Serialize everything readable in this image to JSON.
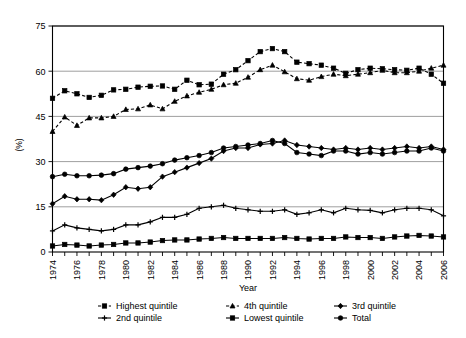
{
  "chart_data": {
    "type": "line",
    "title": "",
    "xlabel": "Year",
    "ylabel": "(%)",
    "ylim": [
      0,
      75
    ],
    "yticks": [
      0,
      15,
      30,
      45,
      60,
      75
    ],
    "xlim": [
      1974,
      2006
    ],
    "xticks": [
      1974,
      1975,
      1976,
      1977,
      1978,
      1979,
      1980,
      1981,
      1982,
      1983,
      1984,
      1985,
      1986,
      1987,
      1988,
      1989,
      1990,
      1991,
      1992,
      1993,
      1994,
      1995,
      1996,
      1997,
      1998,
      1999,
      2000,
      2001,
      2002,
      2003,
      2004,
      2005,
      2006
    ],
    "xtick_labels": [
      "1974",
      "",
      "1976",
      "",
      "1978",
      "",
      "1980",
      "",
      "1982",
      "",
      "1984",
      "",
      "1986",
      "",
      "1988",
      "",
      "1990",
      "",
      "1992",
      "",
      "1994",
      "",
      "1996",
      "",
      "1998",
      "",
      "2000",
      "",
      "2002",
      "",
      "2004",
      "",
      "2006"
    ],
    "grid": "horizontal",
    "legend_position": "bottom",
    "x": [
      1974,
      1975,
      1976,
      1977,
      1978,
      1979,
      1980,
      1981,
      1982,
      1983,
      1984,
      1985,
      1986,
      1987,
      1988,
      1989,
      1990,
      1991,
      1992,
      1993,
      1994,
      1995,
      1996,
      1997,
      1998,
      1999,
      2000,
      2001,
      2002,
      2003,
      2004,
      2005,
      2006
    ],
    "series": [
      {
        "name": "Highest quintile",
        "marker": "square",
        "linestyle": "dashed",
        "color": "#000000",
        "values": [
          51.0,
          53.5,
          52.5,
          51.3,
          52.0,
          53.8,
          54.0,
          54.7,
          55.0,
          55.1,
          54.0,
          57.0,
          55.5,
          55.7,
          59.0,
          60.5,
          63.5,
          66.5,
          67.5,
          66.5,
          63.0,
          62.5,
          62.0,
          61.0,
          59.3,
          60.5,
          61.0,
          60.8,
          60.5,
          60.3,
          61.0,
          59.0,
          56.0
        ]
      },
      {
        "name": "4th quintile",
        "marker": "triangle",
        "linestyle": "dashed",
        "color": "#000000",
        "values": [
          40.0,
          44.8,
          42.0,
          44.5,
          44.5,
          45.0,
          47.3,
          47.5,
          48.8,
          47.5,
          50.0,
          51.8,
          53.0,
          54.0,
          55.5,
          56.0,
          58.0,
          60.5,
          62.0,
          59.8,
          57.5,
          57.0,
          58.2,
          59.0,
          58.5,
          59.0,
          59.5,
          60.3,
          59.5,
          59.5,
          60.0,
          61.0,
          62.0
        ]
      },
      {
        "name": "3rd quintile",
        "marker": "diamond",
        "linestyle": "solid",
        "color": "#000000",
        "values": [
          16.0,
          18.5,
          17.5,
          17.5,
          17.2,
          19.0,
          21.5,
          21.0,
          21.5,
          25.0,
          26.5,
          28.0,
          29.5,
          31.0,
          33.5,
          34.5,
          34.5,
          35.7,
          36.0,
          37.0,
          35.5,
          35.0,
          34.5,
          34.0,
          34.5,
          34.0,
          34.5,
          34.0,
          34.5,
          35.0,
          34.5,
          35.0,
          34.0
        ]
      },
      {
        "name": "2nd quintile",
        "marker": "plus",
        "linestyle": "solid",
        "color": "#000000",
        "values": [
          7.0,
          9.0,
          8.0,
          7.5,
          7.0,
          7.5,
          9.0,
          9.0,
          10.0,
          11.5,
          11.5,
          12.5,
          14.5,
          15.0,
          15.5,
          14.5,
          14.0,
          13.5,
          13.5,
          14.0,
          12.5,
          13.0,
          14.0,
          13.0,
          14.5,
          14.0,
          13.8,
          13.0,
          14.0,
          14.5,
          14.5,
          14.0,
          12.0
        ]
      },
      {
        "name": "Lowest quintile",
        "marker": "square",
        "linestyle": "solid",
        "color": "#000000",
        "values": [
          2.0,
          2.5,
          2.3,
          2.0,
          2.3,
          2.5,
          3.0,
          3.0,
          3.3,
          3.8,
          4.0,
          4.0,
          4.3,
          4.5,
          4.8,
          4.5,
          4.5,
          4.5,
          4.5,
          4.8,
          4.5,
          4.3,
          4.5,
          4.5,
          5.0,
          4.8,
          4.8,
          4.5,
          5.0,
          5.3,
          5.5,
          5.3,
          5.0
        ]
      },
      {
        "name": "Total",
        "marker": "circle",
        "linestyle": "solid",
        "color": "#000000",
        "values": [
          25.0,
          25.8,
          25.3,
          25.3,
          25.5,
          26.0,
          27.5,
          28.0,
          28.5,
          29.3,
          30.5,
          31.3,
          32.0,
          33.0,
          34.5,
          35.0,
          35.5,
          36.0,
          37.0,
          36.0,
          33.0,
          32.5,
          32.0,
          33.5,
          33.5,
          32.5,
          33.0,
          32.5,
          33.0,
          33.5,
          33.5,
          34.5,
          33.5
        ]
      }
    ]
  },
  "legend": {
    "items": [
      {
        "label": "Highest quintile"
      },
      {
        "label": "4th quintile"
      },
      {
        "label": "3rd quintile"
      },
      {
        "label": "2nd quintile"
      },
      {
        "label": "Lowest quintile"
      },
      {
        "label": "Total"
      }
    ]
  }
}
